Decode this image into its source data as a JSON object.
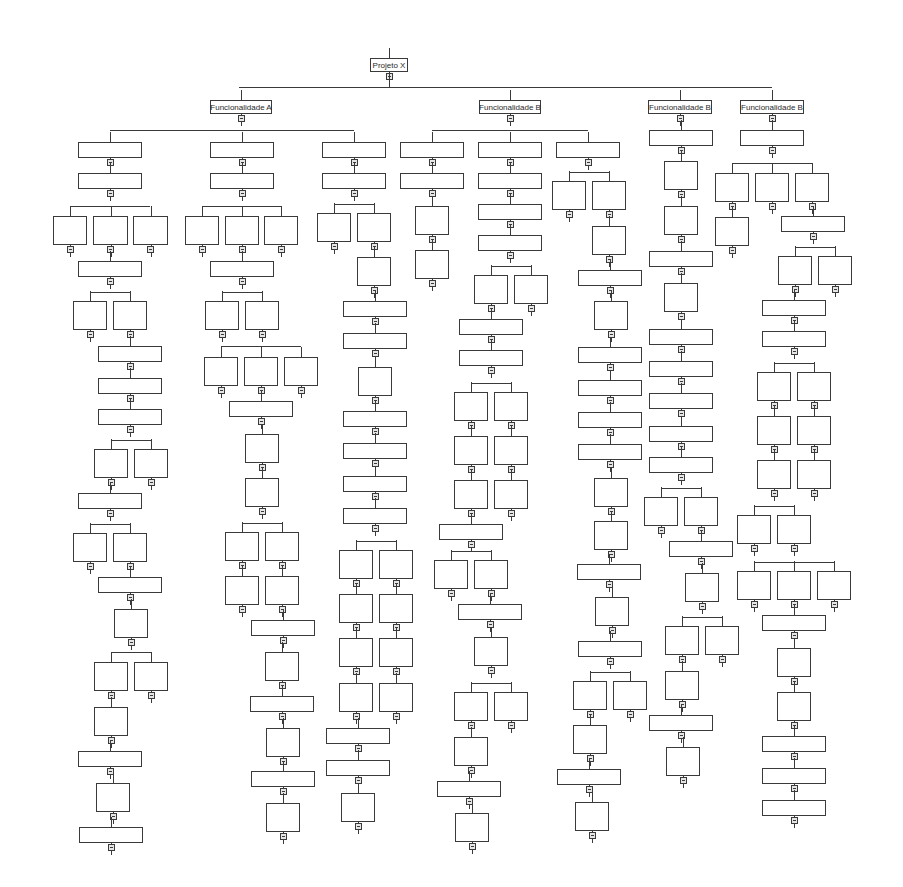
{
  "diagram": {
    "type": "hierarchy-tree",
    "root": {
      "label": "Projeto X"
    },
    "branches": [
      {
        "label": "Funcionalidade A"
      },
      {
        "label": "Funcionalidade B"
      },
      {
        "label": "Funcionalidade B"
      },
      {
        "label": "Funcionalidade B"
      }
    ],
    "line_color": "#3a3a3a",
    "collapse_marker_color": "#e6e6e6"
  },
  "nodes": [
    {
      "id": "root",
      "x": 370,
      "y": 58,
      "w": 38,
      "h": 14,
      "label": "Projeto X"
    },
    {
      "id": "fa",
      "x": 210,
      "y": 100,
      "w": 62,
      "h": 14,
      "label": "Funcionalidade A"
    },
    {
      "id": "fb1",
      "x": 479,
      "y": 100,
      "w": 62,
      "h": 14,
      "label": "Funcionalidade B"
    },
    {
      "id": "fb2",
      "x": 648,
      "y": 100,
      "w": 64,
      "h": 14,
      "label": "Funcionalidade B"
    },
    {
      "id": "fb3",
      "x": 740,
      "y": 100,
      "w": 64,
      "h": 14,
      "label": "Funcionalidade B"
    },
    {
      "x": 78,
      "y": 142,
      "w": 64,
      "h": 16
    },
    {
      "x": 78,
      "y": 173,
      "w": 64,
      "h": 16
    },
    {
      "x": 53,
      "y": 216,
      "w": 34,
      "h": 29
    },
    {
      "x": 93,
      "y": 216,
      "w": 35,
      "h": 29
    },
    {
      "x": 133,
      "y": 216,
      "w": 35,
      "h": 29
    },
    {
      "x": 78,
      "y": 261,
      "w": 64,
      "h": 16
    },
    {
      "x": 73,
      "y": 301,
      "w": 34,
      "h": 29
    },
    {
      "x": 113,
      "y": 301,
      "w": 34,
      "h": 29
    },
    {
      "x": 98,
      "y": 346,
      "w": 64,
      "h": 16
    },
    {
      "x": 98,
      "y": 378,
      "w": 64,
      "h": 16
    },
    {
      "x": 98,
      "y": 409,
      "w": 64,
      "h": 16
    },
    {
      "x": 94,
      "y": 449,
      "w": 34,
      "h": 29
    },
    {
      "x": 134,
      "y": 449,
      "w": 34,
      "h": 29
    },
    {
      "x": 78,
      "y": 493,
      "w": 64,
      "h": 16
    },
    {
      "x": 73,
      "y": 533,
      "w": 34,
      "h": 29
    },
    {
      "x": 113,
      "y": 533,
      "w": 34,
      "h": 29
    },
    {
      "x": 98,
      "y": 577,
      "w": 64,
      "h": 16
    },
    {
      "x": 114,
      "y": 609,
      "w": 34,
      "h": 29
    },
    {
      "x": 94,
      "y": 662,
      "w": 34,
      "h": 29
    },
    {
      "x": 134,
      "y": 662,
      "w": 34,
      "h": 29
    },
    {
      "x": 94,
      "y": 707,
      "w": 34,
      "h": 29
    },
    {
      "x": 78,
      "y": 751,
      "w": 64,
      "h": 16
    },
    {
      "x": 96,
      "y": 783,
      "w": 34,
      "h": 29
    },
    {
      "x": 79,
      "y": 827,
      "w": 64,
      "h": 16
    },
    {
      "x": 210,
      "y": 142,
      "w": 64,
      "h": 16
    },
    {
      "x": 210,
      "y": 173,
      "w": 64,
      "h": 16
    },
    {
      "x": 185,
      "y": 216,
      "w": 34,
      "h": 29
    },
    {
      "x": 225,
      "y": 216,
      "w": 34,
      "h": 29
    },
    {
      "x": 264,
      "y": 216,
      "w": 34,
      "h": 29
    },
    {
      "x": 210,
      "y": 261,
      "w": 64,
      "h": 16
    },
    {
      "x": 205,
      "y": 301,
      "w": 34,
      "h": 29
    },
    {
      "x": 245,
      "y": 301,
      "w": 34,
      "h": 29
    },
    {
      "x": 204,
      "y": 357,
      "w": 34,
      "h": 29
    },
    {
      "x": 244,
      "y": 357,
      "w": 34,
      "h": 29
    },
    {
      "x": 284,
      "y": 357,
      "w": 34,
      "h": 29
    },
    {
      "x": 229,
      "y": 401,
      "w": 64,
      "h": 16
    },
    {
      "x": 245,
      "y": 434,
      "w": 34,
      "h": 29
    },
    {
      "x": 245,
      "y": 478,
      "w": 34,
      "h": 29
    },
    {
      "x": 225,
      "y": 532,
      "w": 34,
      "h": 29
    },
    {
      "x": 265,
      "y": 532,
      "w": 34,
      "h": 29
    },
    {
      "x": 225,
      "y": 576,
      "w": 34,
      "h": 29
    },
    {
      "x": 265,
      "y": 576,
      "w": 34,
      "h": 29
    },
    {
      "x": 251,
      "y": 620,
      "w": 64,
      "h": 16
    },
    {
      "x": 265,
      "y": 652,
      "w": 34,
      "h": 29
    },
    {
      "x": 250,
      "y": 696,
      "w": 64,
      "h": 16
    },
    {
      "x": 266,
      "y": 728,
      "w": 34,
      "h": 29
    },
    {
      "x": 251,
      "y": 771,
      "w": 64,
      "h": 16
    },
    {
      "x": 266,
      "y": 803,
      "w": 34,
      "h": 29
    },
    {
      "x": 322,
      "y": 142,
      "w": 64,
      "h": 16
    },
    {
      "x": 322,
      "y": 173,
      "w": 64,
      "h": 16
    },
    {
      "x": 317,
      "y": 213,
      "w": 34,
      "h": 29
    },
    {
      "x": 357,
      "y": 213,
      "w": 34,
      "h": 29
    },
    {
      "x": 357,
      "y": 257,
      "w": 34,
      "h": 29
    },
    {
      "x": 343,
      "y": 301,
      "w": 64,
      "h": 16
    },
    {
      "x": 343,
      "y": 333,
      "w": 64,
      "h": 16
    },
    {
      "x": 358,
      "y": 367,
      "w": 34,
      "h": 29
    },
    {
      "x": 343,
      "y": 411,
      "w": 64,
      "h": 16
    },
    {
      "x": 343,
      "y": 443,
      "w": 64,
      "h": 16
    },
    {
      "x": 343,
      "y": 476,
      "w": 64,
      "h": 16
    },
    {
      "x": 343,
      "y": 508,
      "w": 64,
      "h": 16
    },
    {
      "x": 339,
      "y": 550,
      "w": 34,
      "h": 29
    },
    {
      "x": 379,
      "y": 550,
      "w": 34,
      "h": 29
    },
    {
      "x": 339,
      "y": 594,
      "w": 34,
      "h": 29
    },
    {
      "x": 379,
      "y": 594,
      "w": 34,
      "h": 29
    },
    {
      "x": 339,
      "y": 638,
      "w": 34,
      "h": 29
    },
    {
      "x": 379,
      "y": 638,
      "w": 34,
      "h": 29
    },
    {
      "x": 339,
      "y": 683,
      "w": 34,
      "h": 29
    },
    {
      "x": 379,
      "y": 683,
      "w": 34,
      "h": 29
    },
    {
      "x": 326,
      "y": 728,
      "w": 64,
      "h": 16
    },
    {
      "x": 326,
      "y": 760,
      "w": 64,
      "h": 16
    },
    {
      "x": 341,
      "y": 793,
      "w": 34,
      "h": 29
    },
    {
      "x": 400,
      "y": 142,
      "w": 64,
      "h": 16
    },
    {
      "x": 400,
      "y": 173,
      "w": 64,
      "h": 16
    },
    {
      "x": 415,
      "y": 206,
      "w": 34,
      "h": 29
    },
    {
      "x": 415,
      "y": 250,
      "w": 34,
      "h": 29
    },
    {
      "x": 478,
      "y": 142,
      "w": 64,
      "h": 16
    },
    {
      "x": 478,
      "y": 173,
      "w": 64,
      "h": 16
    },
    {
      "x": 478,
      "y": 204,
      "w": 64,
      "h": 16
    },
    {
      "x": 478,
      "y": 235,
      "w": 64,
      "h": 16
    },
    {
      "x": 474,
      "y": 275,
      "w": 34,
      "h": 29
    },
    {
      "x": 514,
      "y": 275,
      "w": 34,
      "h": 29
    },
    {
      "x": 459,
      "y": 319,
      "w": 64,
      "h": 16
    },
    {
      "x": 459,
      "y": 350,
      "w": 64,
      "h": 16
    },
    {
      "x": 454,
      "y": 392,
      "w": 34,
      "h": 29
    },
    {
      "x": 494,
      "y": 392,
      "w": 34,
      "h": 29
    },
    {
      "x": 454,
      "y": 436,
      "w": 34,
      "h": 29
    },
    {
      "x": 494,
      "y": 436,
      "w": 34,
      "h": 29
    },
    {
      "x": 454,
      "y": 480,
      "w": 34,
      "h": 29
    },
    {
      "x": 494,
      "y": 480,
      "w": 34,
      "h": 29
    },
    {
      "x": 439,
      "y": 524,
      "w": 64,
      "h": 16
    },
    {
      "x": 434,
      "y": 560,
      "w": 34,
      "h": 29
    },
    {
      "x": 474,
      "y": 560,
      "w": 34,
      "h": 29
    },
    {
      "x": 458,
      "y": 604,
      "w": 64,
      "h": 16
    },
    {
      "x": 474,
      "y": 637,
      "w": 34,
      "h": 29
    },
    {
      "x": 454,
      "y": 692,
      "w": 34,
      "h": 29
    },
    {
      "x": 494,
      "y": 692,
      "w": 34,
      "h": 29
    },
    {
      "x": 454,
      "y": 737,
      "w": 34,
      "h": 29
    },
    {
      "x": 437,
      "y": 781,
      "w": 64,
      "h": 16
    },
    {
      "x": 455,
      "y": 813,
      "w": 34,
      "h": 29
    },
    {
      "x": 556,
      "y": 142,
      "w": 64,
      "h": 16
    },
    {
      "x": 552,
      "y": 181,
      "w": 34,
      "h": 29
    },
    {
      "x": 592,
      "y": 181,
      "w": 34,
      "h": 29
    },
    {
      "x": 592,
      "y": 226,
      "w": 34,
      "h": 29
    },
    {
      "x": 578,
      "y": 270,
      "w": 64,
      "h": 16
    },
    {
      "x": 594,
      "y": 301,
      "w": 34,
      "h": 29
    },
    {
      "x": 578,
      "y": 347,
      "w": 64,
      "h": 16
    },
    {
      "x": 578,
      "y": 380,
      "w": 64,
      "h": 16
    },
    {
      "x": 578,
      "y": 412,
      "w": 64,
      "h": 16
    },
    {
      "x": 578,
      "y": 444,
      "w": 64,
      "h": 16
    },
    {
      "x": 594,
      "y": 478,
      "w": 34,
      "h": 29
    },
    {
      "x": 594,
      "y": 521,
      "w": 34,
      "h": 29
    },
    {
      "x": 577,
      "y": 564,
      "w": 64,
      "h": 16
    },
    {
      "x": 595,
      "y": 597,
      "w": 34,
      "h": 29
    },
    {
      "x": 578,
      "y": 641,
      "w": 64,
      "h": 16
    },
    {
      "x": 573,
      "y": 681,
      "w": 34,
      "h": 29
    },
    {
      "x": 613,
      "y": 681,
      "w": 34,
      "h": 29
    },
    {
      "x": 573,
      "y": 725,
      "w": 34,
      "h": 29
    },
    {
      "x": 557,
      "y": 769,
      "w": 64,
      "h": 16
    },
    {
      "x": 575,
      "y": 802,
      "w": 34,
      "h": 29
    },
    {
      "x": 649,
      "y": 130,
      "w": 64,
      "h": 16
    },
    {
      "x": 664,
      "y": 161,
      "w": 34,
      "h": 29
    },
    {
      "x": 664,
      "y": 206,
      "w": 34,
      "h": 29
    },
    {
      "x": 649,
      "y": 251,
      "w": 64,
      "h": 16
    },
    {
      "x": 664,
      "y": 283,
      "w": 34,
      "h": 29
    },
    {
      "x": 649,
      "y": 329,
      "w": 64,
      "h": 16
    },
    {
      "x": 649,
      "y": 361,
      "w": 64,
      "h": 16
    },
    {
      "x": 649,
      "y": 393,
      "w": 64,
      "h": 16
    },
    {
      "x": 649,
      "y": 426,
      "w": 64,
      "h": 16
    },
    {
      "x": 649,
      "y": 457,
      "w": 64,
      "h": 16
    },
    {
      "x": 644,
      "y": 497,
      "w": 34,
      "h": 29
    },
    {
      "x": 684,
      "y": 497,
      "w": 34,
      "h": 29
    },
    {
      "x": 669,
      "y": 541,
      "w": 64,
      "h": 16
    },
    {
      "x": 685,
      "y": 573,
      "w": 34,
      "h": 29
    },
    {
      "x": 665,
      "y": 626,
      "w": 34,
      "h": 29
    },
    {
      "x": 705,
      "y": 626,
      "w": 34,
      "h": 29
    },
    {
      "x": 665,
      "y": 671,
      "w": 34,
      "h": 29
    },
    {
      "x": 649,
      "y": 715,
      "w": 64,
      "h": 16
    },
    {
      "x": 666,
      "y": 747,
      "w": 34,
      "h": 29
    },
    {
      "x": 740,
      "y": 130,
      "w": 64,
      "h": 16
    },
    {
      "x": 715,
      "y": 173,
      "w": 34,
      "h": 29
    },
    {
      "x": 755,
      "y": 173,
      "w": 34,
      "h": 29
    },
    {
      "x": 795,
      "y": 173,
      "w": 34,
      "h": 29
    },
    {
      "x": 715,
      "y": 217,
      "w": 34,
      "h": 29
    },
    {
      "x": 781,
      "y": 216,
      "w": 64,
      "h": 16
    },
    {
      "x": 778,
      "y": 256,
      "w": 34,
      "h": 29
    },
    {
      "x": 818,
      "y": 256,
      "w": 34,
      "h": 29
    },
    {
      "x": 762,
      "y": 300,
      "w": 64,
      "h": 16
    },
    {
      "x": 762,
      "y": 331,
      "w": 64,
      "h": 16
    },
    {
      "x": 757,
      "y": 372,
      "w": 34,
      "h": 29
    },
    {
      "x": 797,
      "y": 372,
      "w": 34,
      "h": 29
    },
    {
      "x": 757,
      "y": 416,
      "w": 34,
      "h": 29
    },
    {
      "x": 797,
      "y": 416,
      "w": 34,
      "h": 29
    },
    {
      "x": 757,
      "y": 460,
      "w": 34,
      "h": 29
    },
    {
      "x": 797,
      "y": 460,
      "w": 34,
      "h": 29
    },
    {
      "x": 737,
      "y": 515,
      "w": 34,
      "h": 29
    },
    {
      "x": 777,
      "y": 515,
      "w": 34,
      "h": 29
    },
    {
      "x": 737,
      "y": 571,
      "w": 34,
      "h": 29
    },
    {
      "x": 777,
      "y": 571,
      "w": 34,
      "h": 29
    },
    {
      "x": 817,
      "y": 571,
      "w": 34,
      "h": 29
    },
    {
      "x": 762,
      "y": 615,
      "w": 64,
      "h": 16
    },
    {
      "x": 777,
      "y": 648,
      "w": 34,
      "h": 29
    },
    {
      "x": 777,
      "y": 692,
      "w": 34,
      "h": 29
    },
    {
      "x": 762,
      "y": 736,
      "w": 64,
      "h": 16
    },
    {
      "x": 762,
      "y": 768,
      "w": 64,
      "h": 16
    },
    {
      "x": 762,
      "y": 800,
      "w": 64,
      "h": 16
    }
  ],
  "hbars": [
    {
      "x1": 239,
      "x2": 772,
      "y": 87
    },
    {
      "x1": 110,
      "x2": 354,
      "y": 130
    },
    {
      "x1": 432,
      "x2": 588,
      "y": 130
    },
    {
      "x1": 70,
      "x2": 150,
      "y": 206
    },
    {
      "x1": 202,
      "x2": 281,
      "y": 206
    },
    {
      "x1": 334,
      "x2": 374,
      "y": 204
    },
    {
      "x1": 90,
      "x2": 130,
      "y": 292
    },
    {
      "x1": 222,
      "x2": 262,
      "y": 292
    },
    {
      "x1": 221,
      "x2": 301,
      "y": 346
    },
    {
      "x1": 111,
      "x2": 151,
      "y": 440
    },
    {
      "x1": 90,
      "x2": 130,
      "y": 524
    },
    {
      "x1": 111,
      "x2": 151,
      "y": 652
    },
    {
      "x1": 242,
      "x2": 282,
      "y": 523
    },
    {
      "x1": 356,
      "x2": 396,
      "y": 541
    },
    {
      "x1": 491,
      "x2": 531,
      "y": 266
    },
    {
      "x1": 471,
      "x2": 511,
      "y": 383
    },
    {
      "x1": 451,
      "x2": 491,
      "y": 551
    },
    {
      "x1": 471,
      "x2": 511,
      "y": 683
    },
    {
      "x1": 569,
      "x2": 609,
      "y": 172
    },
    {
      "x1": 590,
      "x2": 630,
      "y": 672
    },
    {
      "x1": 661,
      "x2": 701,
      "y": 488
    },
    {
      "x1": 682,
      "x2": 722,
      "y": 617
    },
    {
      "x1": 732,
      "x2": 812,
      "y": 163
    },
    {
      "x1": 795,
      "x2": 835,
      "y": 247
    },
    {
      "x1": 774,
      "x2": 814,
      "y": 363
    },
    {
      "x1": 754,
      "x2": 794,
      "y": 506
    },
    {
      "x1": 754,
      "x2": 834,
      "y": 562
    }
  ],
  "background_text": [
    "",
    ""
  ]
}
